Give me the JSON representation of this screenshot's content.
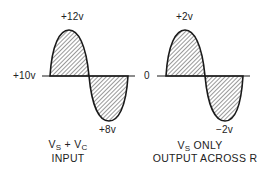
{
  "diagram": {
    "left_waveform": {
      "baseline_label": "+10v",
      "peak_label": "+12v",
      "trough_label": "+8v",
      "caption": {
        "line1_a": "V",
        "line1_a_sub": "S",
        "line1_plus": " + V",
        "line1_b_sub": "C",
        "line2": "INPUT"
      }
    },
    "right_waveform": {
      "baseline_label": "0",
      "peak_label": "+2v",
      "trough_label": "−2v",
      "caption": {
        "line1_a": "V",
        "line1_a_sub": "S",
        "line1_rest": " ONLY",
        "line2": "OUTPUT ACROSS R"
      }
    },
    "colors": {
      "stroke": "#1a1a1a",
      "hatch": "#333333",
      "background": "#ffffff"
    }
  }
}
